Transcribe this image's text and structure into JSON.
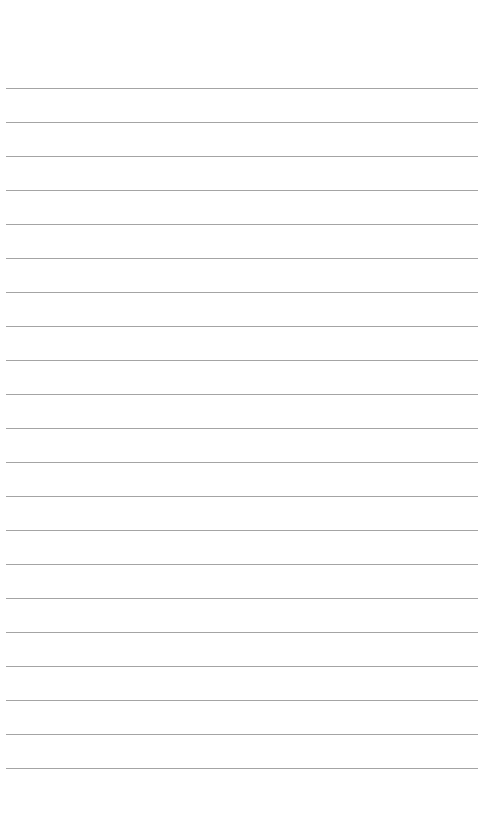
{
  "document": {
    "type": "lined-notepad-page",
    "title": "",
    "body_text": "",
    "page_width": 502,
    "page_height": 834,
    "background_color": "#ffffff"
  },
  "ruling": {
    "line_color": "#9a9a9a",
    "line_thickness": 1,
    "line_count": 21,
    "line_spacing": 34,
    "first_line_y": 88,
    "last_line_y": 768,
    "line_left_x": 6,
    "line_right_x": 478,
    "line_length": 472,
    "lines_y": [
      88,
      122,
      156,
      190,
      224,
      258,
      292,
      326,
      360,
      394,
      428,
      462,
      496,
      530,
      564,
      598,
      632,
      666,
      700,
      734,
      768
    ]
  },
  "margins": {
    "top_margin_height": 88,
    "bottom_margin_height": 58,
    "left_margin_width": 6,
    "right_margin_width": 24
  },
  "content": {
    "lines": [
      "",
      "",
      "",
      "",
      "",
      "",
      "",
      "",
      "",
      "",
      "",
      "",
      "",
      "",
      "",
      "",
      "",
      "",
      "",
      "",
      ""
    ]
  }
}
